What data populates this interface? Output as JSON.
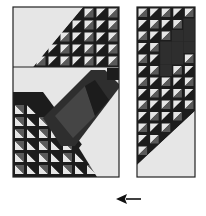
{
  "figure": {
    "colors": {
      "light": "#e6e6e6",
      "dark": "#1c1c1c",
      "medium": "#5a5a5a",
      "band_dark": "#2e2e2e",
      "band_mid": "#454545",
      "border": "#222222"
    },
    "left_panel": {
      "top_section": {
        "grid_cols": 7,
        "grid_rows": 5,
        "staircase": "upper-right"
      },
      "bottom_section": {
        "grid_cols": 6,
        "grid_rows": 6,
        "staircase": "lower-left",
        "band": "diagonal dark strip running lower-left to upper-right"
      }
    },
    "right_panel": {
      "grid_cols": 5,
      "grid_rows": 14,
      "staircase": "upper-left region filled, lower-right light"
    },
    "arrow": {
      "direction": "left",
      "icon": "arrow-left-icon"
    }
  }
}
